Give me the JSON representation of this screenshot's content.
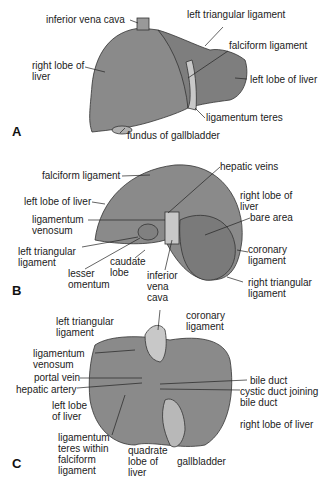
{
  "colors": {
    "liver": "#8a8a8a",
    "liver_dark": "#7a7a7a",
    "pale": "#c8c8c8",
    "line": "#222222"
  },
  "panels": {
    "A": {
      "letter": "A",
      "labels": {
        "ivc": "inferior vena cava",
        "left_triangular": "left triangular ligament",
        "falciform": "falciform ligament",
        "right_lobe": "right lobe of\nliver",
        "left_lobe": "left lobe of liver",
        "lig_teres": "ligamentum teres",
        "fundus": "fundus of gallbladder"
      }
    },
    "B": {
      "letter": "B",
      "labels": {
        "falciform": "falciform ligament",
        "hepatic_veins": "hepatic veins",
        "left_lobe": "left lobe of liver",
        "right_lobe": "right lobe of\nliver",
        "lig_venosum": "ligamentum\nvenosum",
        "bare_area": "bare area",
        "left_triangular": "left triangular\nligament",
        "coronary": "coronary\nligament",
        "caudate": "caudate\nlobe",
        "lesser_omentum": "lesser\nomentum",
        "ivc": "inferior\nvena\ncava",
        "right_triangular": "right triangular\nligament"
      }
    },
    "C": {
      "letter": "C",
      "labels": {
        "left_triangular": "left triangular\nligament",
        "coronary": "coronary\nligament",
        "lig_venosum": "ligamentum\nvenosum",
        "portal_vein": "portal vein",
        "hepatic_artery": "hepatic artery",
        "bile_duct": "bile duct",
        "cystic_duct": "cystic duct joining\nbile duct",
        "left_lobe": "left lobe\nof liver",
        "right_lobe": "right lobe of liver",
        "lig_teres": "ligamentum\nteres within\nfalciform\nligament",
        "quadrate": "quadrate\nlobe of\nliver",
        "gallbladder": "gallbladder"
      }
    }
  }
}
